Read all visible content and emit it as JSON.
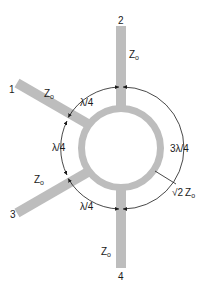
{
  "diagram": {
    "colors": {
      "line": "#bdbdbd",
      "dimension": "#1a1a1a",
      "background": "#ffffff"
    },
    "ports": [
      {
        "id": "1",
        "label": "1",
        "impedance": "Z",
        "impedance_sub": "o"
      },
      {
        "id": "2",
        "label": "2",
        "impedance": "Z",
        "impedance_sub": "o"
      },
      {
        "id": "3",
        "label": "3",
        "impedance": "Z",
        "impedance_sub": "o"
      },
      {
        "id": "4",
        "label": "4",
        "impedance": "Z",
        "impedance_sub": "o"
      }
    ],
    "sections": [
      {
        "between": "1-2",
        "length": "λ/4"
      },
      {
        "between": "1-3",
        "length": "λ/4"
      },
      {
        "between": "3-4",
        "length": "λ/4"
      },
      {
        "between": "2-4",
        "length": "3λ/4"
      }
    ],
    "ring_impedance": {
      "radical": "√",
      "value": "2",
      "symbol": "Z",
      "sub": "o"
    }
  }
}
